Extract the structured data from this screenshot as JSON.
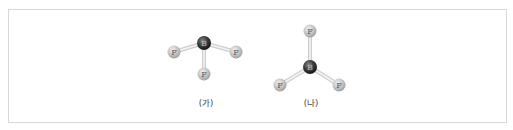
{
  "figure": {
    "molecules": [
      {
        "id": "ga",
        "caption": "(가)",
        "center_atom": "B",
        "ligands": [
          "F",
          "F",
          "F"
        ],
        "geometry": "trigonal-pyramidal-like (F atoms below B)"
      },
      {
        "id": "na",
        "caption": "(나)",
        "center_atom": "B",
        "ligands": [
          "F",
          "F",
          "F"
        ],
        "geometry": "trigonal-planar"
      }
    ],
    "colors": {
      "boron": "#3a3a3a",
      "fluorine": "#bdbdbd",
      "bond": "#d4d4d4",
      "frame": "#d8d8d8"
    }
  }
}
